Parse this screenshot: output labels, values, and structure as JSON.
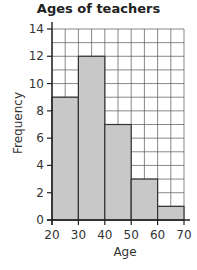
{
  "chart_data": {
    "type": "bar",
    "subtype": "histogram",
    "title": "Ages of teachers",
    "xlabel": "Age",
    "ylabel": "Frequency",
    "bins": [
      [
        20,
        30
      ],
      [
        30,
        40
      ],
      [
        40,
        50
      ],
      [
        50,
        60
      ],
      [
        60,
        70
      ]
    ],
    "categories": [
      "20-30",
      "30-40",
      "40-50",
      "50-60",
      "60-70"
    ],
    "values": [
      9,
      12,
      7,
      3,
      1
    ],
    "xlim": [
      20,
      70
    ],
    "ylim": [
      0,
      14
    ],
    "xticks": [
      20,
      30,
      40,
      50,
      60,
      70
    ],
    "yticks": [
      0,
      2,
      4,
      6,
      8,
      10,
      12,
      14
    ],
    "grid": true,
    "grid_x_step": 5,
    "grid_y_step": 1,
    "legend": null,
    "colors": {
      "bar_fill": "#c8c8c8",
      "bar_edge": "#333333",
      "grid": "#555555"
    }
  }
}
